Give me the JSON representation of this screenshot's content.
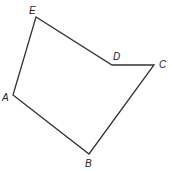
{
  "figure": {
    "type": "pentagon",
    "stroke_color": "#333333",
    "background": "#ffffff",
    "vertices": [
      {
        "name": "A",
        "x": 13,
        "y": 95,
        "label_x": 2,
        "label_y": 101
      },
      {
        "name": "B",
        "x": 89,
        "y": 154,
        "label_x": 85,
        "label_y": 167
      },
      {
        "name": "C",
        "x": 154,
        "y": 65,
        "label_x": 159,
        "label_y": 68
      },
      {
        "name": "D",
        "x": 112,
        "y": 65,
        "label_x": 113,
        "label_y": 60
      },
      {
        "name": "E",
        "x": 36,
        "y": 17,
        "label_x": 29,
        "label_y": 14
      }
    ],
    "edges": [
      [
        "A",
        "B"
      ],
      [
        "B",
        "C"
      ],
      [
        "C",
        "D"
      ],
      [
        "D",
        "E"
      ],
      [
        "E",
        "A"
      ]
    ]
  }
}
